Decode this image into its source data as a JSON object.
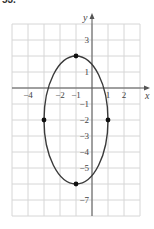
{
  "problem_number": "53.",
  "chart_data": {
    "type": "line",
    "title": "",
    "xlabel": "x",
    "ylabel": "y",
    "xlim": [
      -5,
      3
    ],
    "ylim": [
      -8,
      4
    ],
    "grid": true,
    "legend": null,
    "x_tick_labels": [
      "-4",
      "-2",
      "-1",
      "1",
      "2"
    ],
    "x_tick_values": [
      -4,
      -2,
      -1,
      1,
      2
    ],
    "y_tick_labels": [
      "3",
      "1",
      "-1",
      "-2",
      "-3",
      "-4",
      "-5",
      "-7"
    ],
    "y_tick_values": [
      3,
      1,
      -1,
      -2,
      -3,
      -4,
      -5,
      -7
    ],
    "curve": {
      "kind": "ellipse",
      "center": [
        -1,
        -2
      ],
      "semi_axis_x": 2,
      "semi_axis_y": 4,
      "equation": "(x+1)^2/4 + (y+2)^2/16 = 1"
    },
    "points": [
      {
        "x": -1,
        "y": 2
      },
      {
        "x": -1,
        "y": -6
      },
      {
        "x": -3,
        "y": -2
      },
      {
        "x": 1,
        "y": -2
      }
    ],
    "colors": {
      "curve": "#3a3a3a",
      "grid": "#d6d6d6",
      "axis": "#555555",
      "points": "#111111"
    }
  }
}
